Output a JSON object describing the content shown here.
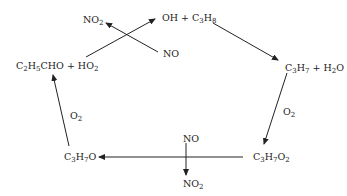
{
  "diagram": {
    "type": "reaction-cycle",
    "nodes": [
      {
        "id": "start",
        "parts": [
          [
            "OH + C",
            "3",
            "H",
            "8"
          ]
        ]
      },
      {
        "id": "c3h7",
        "parts": [
          [
            "C",
            "3",
            "H",
            "7",
            " + H",
            "2",
            "O"
          ]
        ]
      },
      {
        "id": "c3h7o2",
        "parts": [
          [
            "C",
            "3",
            "H",
            "7",
            "O",
            "2"
          ]
        ]
      },
      {
        "id": "c3h7o",
        "parts": [
          [
            "C",
            "3",
            "H",
            "7",
            "O"
          ]
        ]
      },
      {
        "id": "c2h5cho",
        "parts": [
          [
            "C",
            "2",
            "H",
            "5",
            "CHO + HO",
            "2"
          ]
        ]
      }
    ],
    "edges": [
      {
        "from": "start",
        "to": "c3h7",
        "label": ""
      },
      {
        "from": "c3h7",
        "to": "c3h7o2",
        "label": "O2"
      },
      {
        "from": "c3h7o2",
        "to": "c3h7o",
        "label": "NO → NO2"
      },
      {
        "from": "c3h7o",
        "to": "c2h5cho",
        "label": "O2"
      },
      {
        "from": "c2h5cho",
        "to": "start",
        "label": "NO → NO2"
      }
    ],
    "labels": {
      "oh": "OH + C",
      "oh_s": "3",
      "oh_h": "H",
      "oh_s2": "8",
      "c3h7_a": "C",
      "c3h7_s1": "3",
      "c3h7_b": "H",
      "c3h7_s2": "7",
      "c3h7_c": " + H",
      "c3h7_s3": "2",
      "c3h7_d": "O",
      "o2_right_a": "O",
      "o2_right_s": "2",
      "c3h7o2_a": "C",
      "c3h7o2_s1": "3",
      "c3h7o2_b": "H",
      "c3h7o2_s2": "7",
      "c3h7o2_c": "O",
      "c3h7o2_s3": "2",
      "no_bottom": "NO",
      "no2_bottom_a": "NO",
      "no2_bottom_s": "2",
      "c3h7o_a": "C",
      "c3h7o_s1": "3",
      "c3h7o_b": "H",
      "c3h7o_s2": "7",
      "c3h7o_c": "O",
      "o2_left_a": "O",
      "o2_left_s": "2",
      "c2h5_a": "C",
      "c2h5_s1": "2",
      "c2h5_b": "H",
      "c2h5_s2": "5",
      "c2h5_c": "CHO + HO",
      "c2h5_s3": "2",
      "no2_top_a": "NO",
      "no2_top_s": "2",
      "no_top": "NO"
    }
  }
}
